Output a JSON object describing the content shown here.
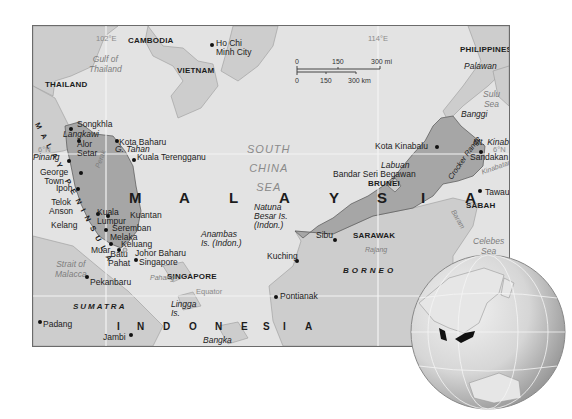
{
  "map": {
    "title": "Malaysia",
    "graticule": {
      "lon_left": "102°E",
      "lon_right": "114°E",
      "lat_6n_left": "6°N",
      "lat_6n_right": "6°N",
      "equator": "Equator"
    },
    "scale": {
      "mi_labels": [
        "0",
        "150",
        "300 mi"
      ],
      "km_labels": [
        "0",
        "150",
        "300 km"
      ]
    },
    "countries": {
      "cambodia": "CAMBODIA",
      "vietnam": "VIETNAM",
      "thailand": "THAILAND",
      "philippines": "PHILIPPINES",
      "brunei": "BRUNEI",
      "singapore": "SINGAPORE",
      "malaysia_letters": [
        "M",
        "A",
        "L",
        "A",
        "Y",
        "S",
        "I",
        "A"
      ],
      "indonesia_letters": [
        "I",
        "N",
        "D",
        "O",
        "N",
        "E",
        "S",
        "I",
        "A"
      ]
    },
    "regions": {
      "sarawak": "SARAWAK",
      "sabah": "SABAH",
      "malay_peninsula": "MALAY PENINSULA"
    },
    "waters": {
      "gulf_line1": "Gulf of",
      "gulf_line2": "Thailand",
      "scs_line1": "SOUTH",
      "scs_line2": "CHINA",
      "scs_line3": "SEA",
      "sulu_line1": "Sulu",
      "sulu_line2": "Sea",
      "celebes_line1": "Celebes",
      "celebes_line2": "Sea",
      "strait_line1": "Strait of",
      "strait_line2": "Malacca"
    },
    "islands": {
      "palawan": "Palawan",
      "banggi": "Banggi",
      "labuan": "Labuan",
      "langkawi": "Langkawi",
      "pinang": "Pinang",
      "borneo": "BORNEO",
      "sumatra": "SUMATRA",
      "bangka": "Bangka",
      "lingga_1": "Lingga",
      "lingga_2": "Is.",
      "anambas_1": "Anambas",
      "anambas_2": "Is. (Indon.)",
      "natuna_1": "Natuna",
      "natuna_2": "Besar Is.",
      "natuna_3": "(Indon.)"
    },
    "features": {
      "g_tahan": "G. Tahan",
      "mt_kinabalu": "Mt. Kinabalu",
      "crocker": "Crocker Range",
      "pahang": "Pahang",
      "perak": "Perak",
      "rajang": "Rajang",
      "baram": "Baram",
      "kinabatangan": "Kinabatangan"
    },
    "cities": {
      "ho_chi_1": "Ho Chi",
      "ho_chi_2": "Minh City",
      "songkhla": "Songkhla",
      "alor_1": "Alor",
      "alor_2": "Setar",
      "kota_baharu": "Kota Baharu",
      "george_1": "George",
      "george_2": "Town",
      "kuala_terengganu": "Kuala Terengganu",
      "ipoh": "Ipoh",
      "telok_1": "Telok",
      "telok_2": "Anson",
      "kl_1": "Kuala",
      "kl_2": "Lumpur",
      "kuantan": "Kuantan",
      "kelang": "Kelang",
      "seremban": "Seremban",
      "melaka": "Melaka",
      "keluang": "Keluang",
      "muar": "Muar",
      "batu_1": "Batu",
      "batu_2": "Pahat",
      "johor": "Johor Baharu",
      "singapore_city": "Singapore",
      "pekanbaru": "Pekanbaru",
      "padang": "Padang",
      "jambi": "Jambi",
      "kota_kinabalu": "Kota Kinabalu",
      "sandakan": "Sandakan",
      "bandar": "Bandar Seri Begawan",
      "tawau": "Tawau",
      "sibu": "Sibu",
      "kuching": "Kuching",
      "pontianak": "Pontianak"
    },
    "colors": {
      "sea": "#e3e3e3",
      "land": "#cdcdcd",
      "malaysia": "#a6a6a6",
      "border": "#4a4a4a"
    }
  },
  "locator_globe": {
    "highlight": "Malaysia"
  }
}
